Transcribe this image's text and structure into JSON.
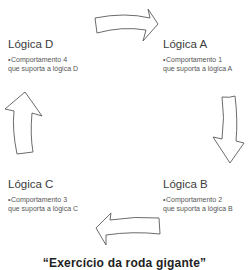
{
  "diagram": {
    "type": "cycle",
    "direction": "clockwise",
    "nodes": [
      {
        "id": "a",
        "title": "Lógica A",
        "desc_line1": "Comportamento 1",
        "desc_line2": "que suporta a lógica A"
      },
      {
        "id": "b",
        "title": "Lógica B",
        "desc_line1": "Comportamento 2",
        "desc_line2": "que suporta a lógica B"
      },
      {
        "id": "c",
        "title": "Lógica C",
        "desc_line1": "Comportamento 3",
        "desc_line2": "que suporta a lógica C"
      },
      {
        "id": "d",
        "title": "Lógica D",
        "desc_line1": "Comportamento 4",
        "desc_line2": "que suporta a lógica D"
      }
    ],
    "arrows": [
      {
        "from": "d",
        "to": "a",
        "icon": "curved-arrow-right-icon"
      },
      {
        "from": "a",
        "to": "b",
        "icon": "curved-arrow-down-icon"
      },
      {
        "from": "b",
        "to": "c",
        "icon": "curved-arrow-left-icon"
      },
      {
        "from": "c",
        "to": "d",
        "icon": "curved-arrow-up-icon"
      }
    ],
    "bullet": "•",
    "caption": "“Exercício da roda gigante”",
    "colors": {
      "arrow_stroke": "#5a5a5a",
      "arrow_fill": "#ffffff",
      "text": "#3c3c3c"
    }
  }
}
